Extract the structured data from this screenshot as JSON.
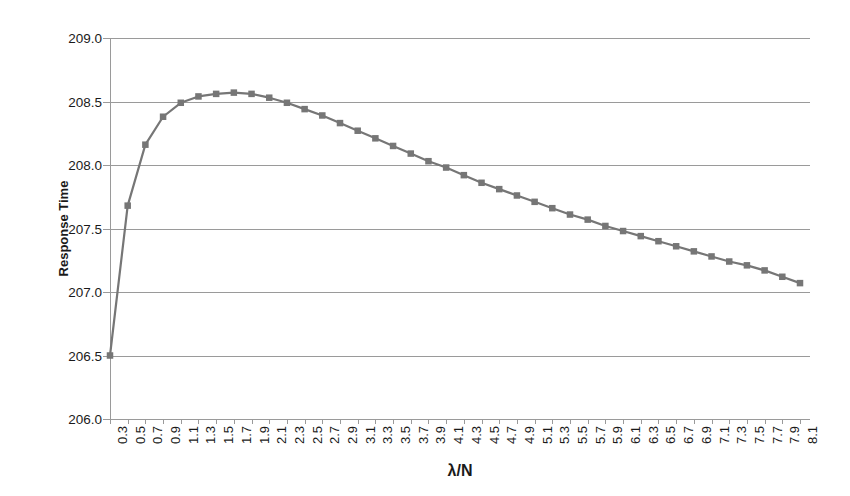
{
  "chart_data": {
    "type": "line",
    "title": "",
    "subtitle": "",
    "xlabel": "λ/N",
    "ylabel": "Response Time",
    "grid": true,
    "legend": false,
    "legend_position": "none",
    "xlim": [
      0.3,
      8.1
    ],
    "ylim": [
      206.0,
      209.0
    ],
    "ytick_labels": [
      "209.0",
      "208.5",
      "208.0",
      "207.5",
      "207.0",
      "206.5",
      "206.0"
    ],
    "ytick_values": [
      209.0,
      208.5,
      208.0,
      207.5,
      207.0,
      206.5,
      206.0
    ],
    "categories": [
      "0.3",
      "0.5",
      "0.7",
      "0.9",
      "1.1",
      "1.3",
      "1.5",
      "1.7",
      "1.9",
      "2.1",
      "2.3",
      "2.5",
      "2.7",
      "2.9",
      "3.1",
      "3.3",
      "3.5",
      "3.7",
      "3.9",
      "4.1",
      "4.3",
      "4.5",
      "4.7",
      "4.9",
      "5.1",
      "5.3",
      "5.5",
      "5.7",
      "5.9",
      "6.1",
      "6.3",
      "6.5",
      "6.7",
      "6.9",
      "7.1",
      "7.3",
      "7.5",
      "7.7",
      "7.9",
      "8.1"
    ],
    "x": [
      0.3,
      0.5,
      0.7,
      0.9,
      1.1,
      1.3,
      1.5,
      1.7,
      1.9,
      2.1,
      2.3,
      2.5,
      2.7,
      2.9,
      3.1,
      3.3,
      3.5,
      3.7,
      3.9,
      4.1,
      4.3,
      4.5,
      4.7,
      4.9,
      5.1,
      5.3,
      5.5,
      5.7,
      5.9,
      6.1,
      6.3,
      6.5,
      6.7,
      6.9,
      7.1,
      7.3,
      7.5,
      7.7,
      7.9,
      8.1
    ],
    "series": [
      {
        "name": "Response Time",
        "color": "#767676",
        "marker": "square",
        "values": [
          206.5,
          207.68,
          208.16,
          208.38,
          208.49,
          208.54,
          208.56,
          208.57,
          208.56,
          208.53,
          208.49,
          208.44,
          208.39,
          208.33,
          208.27,
          208.21,
          208.15,
          208.09,
          208.03,
          207.98,
          207.92,
          207.86,
          207.81,
          207.76,
          207.71,
          207.66,
          207.61,
          207.57,
          207.52,
          207.48,
          207.44,
          207.4,
          207.36,
          207.32,
          207.28,
          207.24,
          207.21,
          207.17,
          207.12,
          207.07
        ]
      }
    ],
    "annotations": []
  }
}
